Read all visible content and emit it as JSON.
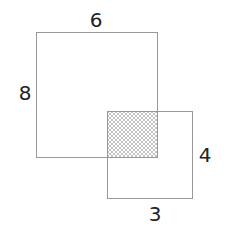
{
  "diagram": {
    "large_square": {
      "width_label": "6",
      "height_label": "8"
    },
    "small_square": {
      "height_label": "4",
      "width_label": "3"
    },
    "overlap": {
      "fill": "crosshatch"
    },
    "colors": {
      "stroke": "#999999",
      "hatch": "#aaaaaa",
      "text": "#222222"
    }
  }
}
